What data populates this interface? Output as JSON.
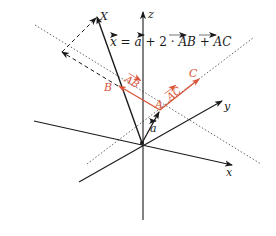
{
  "colors": {
    "axis": "#1a1a1a",
    "accent": "#d9553a",
    "dotted": "#555555",
    "background": "#ffffff"
  },
  "labels": {
    "x_axis": "x",
    "y_axis": "y",
    "z_axis": "z",
    "point_X": "X",
    "point_A": "A",
    "point_B": "B",
    "point_C": "C",
    "vec_a": "a",
    "vec_AB": "AB",
    "vec_AC": "AC",
    "equation": {
      "lhs": "x",
      "eq": " = ",
      "a": "a",
      "plus1": " + 2 · ",
      "AB": "AB",
      "plus2": " + ",
      "AC": "AC"
    }
  },
  "points": {
    "origin": [
      142,
      143
    ],
    "A": [
      160,
      110
    ],
    "B": [
      118,
      86
    ],
    "C": [
      200,
      78
    ],
    "X": [
      97,
      16
    ],
    "dashed_corner": [
      62,
      52
    ]
  }
}
